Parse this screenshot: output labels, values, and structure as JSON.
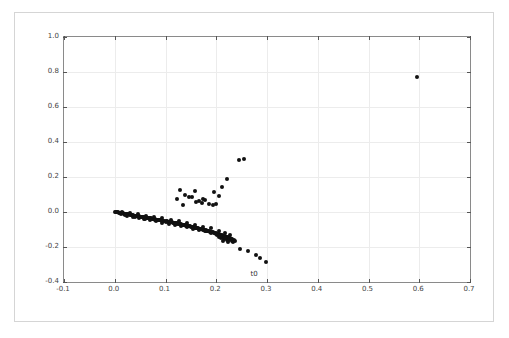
{
  "figure": {
    "background_color": "#ffffff",
    "border_color": "#d5d5d5",
    "axes_border_color": "#8a8a8a",
    "grid_color": "#ececec",
    "marker_color": "#111111"
  },
  "chart_data": {
    "type": "scatter",
    "title": "",
    "xlabel": "t0",
    "ylabel": "t1",
    "xlim": [
      -0.1,
      0.7
    ],
    "ylim": [
      -0.4,
      1.0
    ],
    "xticks": [
      -0.1,
      0.0,
      0.1,
      0.2,
      0.3,
      0.4,
      0.5,
      0.6,
      0.7
    ],
    "xticklabels": [
      "-0.1",
      "0.0",
      "0.1",
      "0.2",
      "0.3",
      "0.4",
      "0.5",
      "0.6",
      "0.7"
    ],
    "yticks": [
      -0.4,
      -0.2,
      0.0,
      0.2,
      0.4,
      0.6,
      0.8,
      1.0
    ],
    "yticklabels": [
      "-0.4",
      "-0.2",
      "0.0",
      "0.2",
      "0.4",
      "0.6",
      "0.8",
      "1.0"
    ],
    "grid": true,
    "legend": null,
    "marker": "circle",
    "marker_color": "#111111",
    "marker_size": 4,
    "series": [
      {
        "name": "points",
        "points": [
          [
            0.595,
            0.77
          ],
          [
            0.245,
            0.3
          ],
          [
            0.254,
            0.301
          ],
          [
            0.222,
            0.188
          ],
          [
            0.212,
            0.142
          ],
          [
            0.128,
            0.128
          ],
          [
            0.158,
            0.118
          ],
          [
            0.196,
            0.112
          ],
          [
            0.139,
            0.1
          ],
          [
            0.205,
            0.09
          ],
          [
            0.152,
            0.088
          ],
          [
            0.147,
            0.083
          ],
          [
            0.122,
            0.074
          ],
          [
            0.174,
            0.074
          ],
          [
            0.178,
            0.07
          ],
          [
            0.166,
            0.062
          ],
          [
            0.16,
            0.055
          ],
          [
            0.171,
            0.05
          ],
          [
            0.186,
            0.048
          ],
          [
            0.199,
            0.046
          ],
          [
            0.193,
            0.042
          ],
          [
            0.134,
            0.04
          ],
          [
            0.0,
            0.0
          ],
          [
            0.002,
            -0.001
          ],
          [
            0.004,
            -0.002
          ],
          [
            0.006,
            -0.002
          ],
          [
            0.008,
            -0.004
          ],
          [
            0.01,
            -0.005
          ],
          [
            0.012,
            -0.006
          ],
          [
            0.014,
            -0.007
          ],
          [
            0.016,
            -0.008
          ],
          [
            0.018,
            -0.009
          ],
          [
            0.02,
            -0.01
          ],
          [
            0.022,
            -0.011
          ],
          [
            0.024,
            -0.012
          ],
          [
            0.026,
            -0.013
          ],
          [
            0.028,
            -0.014
          ],
          [
            0.03,
            -0.016
          ],
          [
            0.032,
            -0.016
          ],
          [
            0.034,
            -0.018
          ],
          [
            0.036,
            -0.019
          ],
          [
            0.038,
            -0.02
          ],
          [
            0.04,
            -0.021
          ],
          [
            0.042,
            -0.022
          ],
          [
            0.044,
            -0.023
          ],
          [
            0.046,
            -0.024
          ],
          [
            0.048,
            -0.025
          ],
          [
            0.05,
            -0.026
          ],
          [
            0.052,
            -0.027
          ],
          [
            0.054,
            -0.028
          ],
          [
            0.056,
            -0.029
          ],
          [
            0.058,
            -0.03
          ],
          [
            0.06,
            -0.031
          ],
          [
            0.062,
            -0.032
          ],
          [
            0.064,
            -0.033
          ],
          [
            0.066,
            -0.034
          ],
          [
            0.068,
            -0.035
          ],
          [
            0.07,
            -0.036
          ],
          [
            0.072,
            -0.037
          ],
          [
            0.074,
            -0.038
          ],
          [
            0.076,
            -0.039
          ],
          [
            0.078,
            -0.04
          ],
          [
            0.08,
            -0.042
          ],
          [
            0.082,
            -0.043
          ],
          [
            0.084,
            -0.044
          ],
          [
            0.086,
            -0.045
          ],
          [
            0.088,
            -0.046
          ],
          [
            0.09,
            -0.047
          ],
          [
            0.092,
            -0.048
          ],
          [
            0.094,
            -0.049
          ],
          [
            0.096,
            -0.05
          ],
          [
            0.098,
            -0.051
          ],
          [
            0.1,
            -0.052
          ],
          [
            0.102,
            -0.054
          ],
          [
            0.104,
            -0.055
          ],
          [
            0.106,
            -0.056
          ],
          [
            0.108,
            -0.057
          ],
          [
            0.11,
            -0.058
          ],
          [
            0.112,
            -0.059
          ],
          [
            0.114,
            -0.061
          ],
          [
            0.116,
            -0.062
          ],
          [
            0.118,
            -0.063
          ],
          [
            0.12,
            -0.064
          ],
          [
            0.122,
            -0.065
          ],
          [
            0.124,
            -0.067
          ],
          [
            0.126,
            -0.068
          ],
          [
            0.128,
            -0.069
          ],
          [
            0.13,
            -0.07
          ],
          [
            0.132,
            -0.072
          ],
          [
            0.134,
            -0.073
          ],
          [
            0.136,
            -0.074
          ],
          [
            0.138,
            -0.075
          ],
          [
            0.14,
            -0.077
          ],
          [
            0.142,
            -0.078
          ],
          [
            0.144,
            -0.079
          ],
          [
            0.146,
            -0.081
          ],
          [
            0.148,
            -0.082
          ],
          [
            0.15,
            -0.083
          ],
          [
            0.152,
            -0.085
          ],
          [
            0.154,
            -0.086
          ],
          [
            0.156,
            -0.087
          ],
          [
            0.158,
            -0.089
          ],
          [
            0.16,
            -0.09
          ],
          [
            0.162,
            -0.092
          ],
          [
            0.164,
            -0.093
          ],
          [
            0.166,
            -0.095
          ],
          [
            0.168,
            -0.096
          ],
          [
            0.17,
            -0.098
          ],
          [
            0.172,
            -0.099
          ],
          [
            0.174,
            -0.101
          ],
          [
            0.176,
            -0.102
          ],
          [
            0.178,
            -0.104
          ],
          [
            0.18,
            -0.105
          ],
          [
            0.182,
            -0.107
          ],
          [
            0.184,
            -0.109
          ],
          [
            0.186,
            -0.11
          ],
          [
            0.188,
            -0.112
          ],
          [
            0.19,
            -0.113
          ],
          [
            0.192,
            -0.115
          ],
          [
            0.194,
            -0.117
          ],
          [
            0.196,
            -0.118
          ],
          [
            0.198,
            -0.12
          ],
          [
            0.2,
            -0.122
          ],
          [
            0.202,
            -0.124
          ],
          [
            0.204,
            -0.125
          ],
          [
            0.206,
            -0.127
          ],
          [
            0.208,
            -0.129
          ],
          [
            0.21,
            -0.131
          ],
          [
            0.212,
            -0.133
          ],
          [
            0.214,
            -0.135
          ],
          [
            0.216,
            -0.137
          ],
          [
            0.218,
            -0.139
          ],
          [
            0.22,
            -0.141
          ],
          [
            0.222,
            -0.143
          ],
          [
            0.224,
            -0.145
          ],
          [
            0.226,
            -0.147
          ],
          [
            0.228,
            -0.149
          ],
          [
            0.23,
            -0.152
          ],
          [
            0.232,
            -0.154
          ],
          [
            0.012,
            -0.012
          ],
          [
            0.024,
            -0.021
          ],
          [
            0.036,
            -0.03
          ],
          [
            0.048,
            -0.036
          ],
          [
            0.058,
            -0.042
          ],
          [
            0.07,
            -0.048
          ],
          [
            0.082,
            -0.053
          ],
          [
            0.094,
            -0.06
          ],
          [
            0.106,
            -0.067
          ],
          [
            0.118,
            -0.074
          ],
          [
            0.13,
            -0.081
          ],
          [
            0.142,
            -0.088
          ],
          [
            0.154,
            -0.095
          ],
          [
            0.166,
            -0.103
          ],
          [
            0.178,
            -0.111
          ],
          [
            0.19,
            -0.12
          ],
          [
            0.202,
            -0.13
          ],
          [
            0.214,
            -0.142
          ],
          [
            0.226,
            -0.154
          ],
          [
            0.234,
            -0.16
          ],
          [
            0.014,
            0.002
          ],
          [
            0.03,
            -0.004
          ],
          [
            0.046,
            -0.012
          ],
          [
            0.062,
            -0.02
          ],
          [
            0.078,
            -0.028
          ],
          [
            0.094,
            -0.036
          ],
          [
            0.11,
            -0.044
          ],
          [
            0.126,
            -0.053
          ],
          [
            0.142,
            -0.062
          ],
          [
            0.158,
            -0.072
          ],
          [
            0.174,
            -0.083
          ],
          [
            0.19,
            -0.094
          ],
          [
            0.206,
            -0.106
          ],
          [
            0.218,
            -0.12
          ],
          [
            0.228,
            -0.134
          ],
          [
            0.02,
            -0.018
          ],
          [
            0.04,
            -0.028
          ],
          [
            0.06,
            -0.038
          ],
          [
            0.08,
            -0.048
          ],
          [
            0.1,
            -0.058
          ],
          [
            0.12,
            -0.07
          ],
          [
            0.14,
            -0.082
          ],
          [
            0.16,
            -0.094
          ],
          [
            0.18,
            -0.108
          ],
          [
            0.2,
            -0.124
          ],
          [
            0.216,
            -0.14
          ],
          [
            0.23,
            -0.156
          ],
          [
            0.209,
            -0.15
          ],
          [
            0.216,
            -0.152
          ],
          [
            0.221,
            -0.158
          ],
          [
            0.226,
            -0.16
          ],
          [
            0.231,
            -0.163
          ],
          [
            0.236,
            -0.166
          ],
          [
            0.213,
            -0.166
          ],
          [
            0.223,
            -0.17
          ],
          [
            0.233,
            -0.172
          ],
          [
            0.206,
            -0.14
          ],
          [
            0.218,
            -0.146
          ],
          [
            0.247,
            -0.213
          ],
          [
            0.262,
            -0.225
          ],
          [
            0.279,
            -0.243
          ],
          [
            0.286,
            -0.262
          ],
          [
            0.299,
            -0.288
          ]
        ]
      }
    ]
  }
}
